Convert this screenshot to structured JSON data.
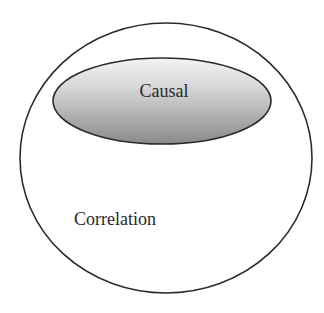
{
  "diagram": {
    "outer_set": {
      "label": "Correlation",
      "fill": "#ffffff",
      "stroke": "#2b2b2b"
    },
    "inner_set": {
      "label": "Causal",
      "gradient_top": "#f2f2f2",
      "gradient_bottom": "#8f8f8f",
      "stroke": "#2b2b2b"
    }
  }
}
